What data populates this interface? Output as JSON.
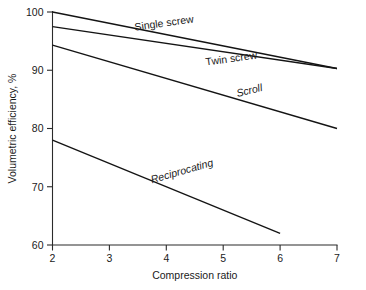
{
  "chart_data": {
    "type": "line",
    "title": "",
    "subtitle": "",
    "xlabel": "Compression  ratio",
    "ylabel": "Volumetric efficiency, %",
    "xlim": [
      2,
      7
    ],
    "ylim": [
      60,
      100
    ],
    "xticks": [
      "2",
      "3",
      "4",
      "5",
      "6",
      "7"
    ],
    "xtick_values": [
      2,
      3,
      4,
      5,
      6,
      7
    ],
    "yticks": [
      "60",
      "70",
      "80",
      "90",
      "100"
    ],
    "ytick_values": [
      60,
      70,
      80,
      90,
      100
    ],
    "grid": false,
    "legend": "inline-labels",
    "series": [
      {
        "name": "Single screw",
        "label": "Single screw",
        "label_rotation": -8,
        "label_x": 3.45,
        "label_y": 96.8,
        "x": [
          2,
          7
        ],
        "values": [
          100.0,
          90.3
        ]
      },
      {
        "name": "Twin screw",
        "label": "Twin screw",
        "label_rotation": -8,
        "label_x": 4.7,
        "label_y": 90.8,
        "x": [
          2,
          7
        ],
        "values": [
          97.5,
          90.3
        ]
      },
      {
        "name": "Scroll",
        "label": "Scroll",
        "label_rotation": -14,
        "label_x": 5.25,
        "label_y": 85.4,
        "x": [
          2,
          7
        ],
        "values": [
          94.3,
          80.0
        ]
      },
      {
        "name": "Reciprocating",
        "label": "Reciprocating",
        "label_rotation": -16,
        "label_x": 3.75,
        "label_y": 70.6,
        "x": [
          2,
          6
        ],
        "values": [
          78.0,
          62.0
        ]
      }
    ]
  }
}
